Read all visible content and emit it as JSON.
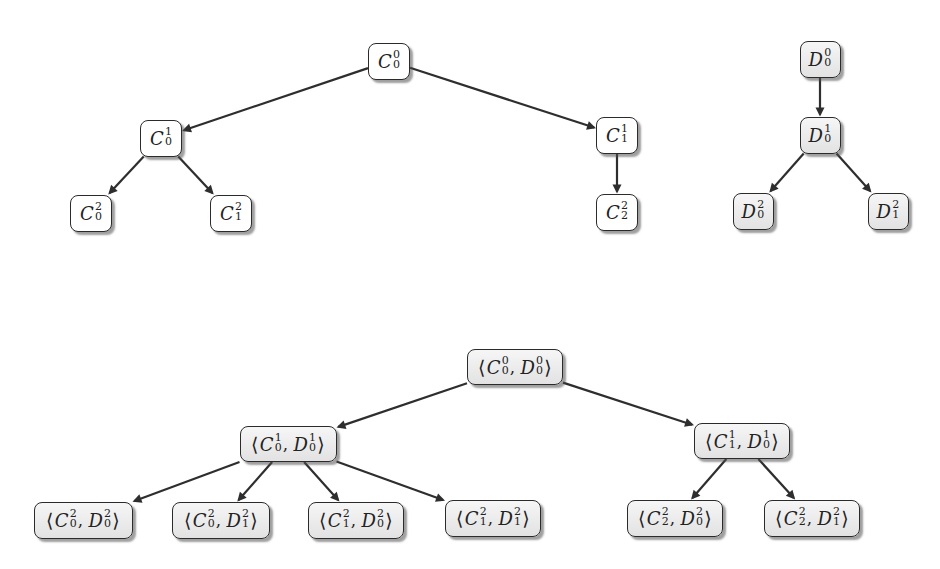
{
  "diagram": {
    "type": "tree-product-diagram",
    "trees": [
      {
        "id": "tree-c",
        "fill": "white",
        "nodes": [
          {
            "id": "c00",
            "label": {
              "base": "C",
              "sup": "0",
              "sub": "0"
            },
            "cx": 389,
            "cy": 61,
            "w": 42,
            "h": 37
          },
          {
            "id": "c01",
            "label": {
              "base": "C",
              "sup": "1",
              "sub": "0"
            },
            "cx": 161,
            "cy": 138,
            "w": 42,
            "h": 37
          },
          {
            "id": "c11",
            "label": {
              "base": "C",
              "sup": "1",
              "sub": "1"
            },
            "cx": 617,
            "cy": 135,
            "w": 42,
            "h": 37
          },
          {
            "id": "c02",
            "label": {
              "base": "C",
              "sup": "2",
              "sub": "0"
            },
            "cx": 91,
            "cy": 213,
            "w": 42,
            "h": 37
          },
          {
            "id": "c12",
            "label": {
              "base": "C",
              "sup": "2",
              "sub": "1"
            },
            "cx": 231,
            "cy": 213,
            "w": 42,
            "h": 37
          },
          {
            "id": "c22",
            "label": {
              "base": "C",
              "sup": "2",
              "sub": "2"
            },
            "cx": 617,
            "cy": 212,
            "w": 42,
            "h": 37
          }
        ],
        "edges": [
          [
            "c00",
            "c01"
          ],
          [
            "c00",
            "c11"
          ],
          [
            "c01",
            "c02"
          ],
          [
            "c01",
            "c12"
          ],
          [
            "c11",
            "c22"
          ]
        ]
      },
      {
        "id": "tree-d",
        "fill": "gray",
        "nodes": [
          {
            "id": "d00",
            "label": {
              "base": "D",
              "sup": "0",
              "sub": "0"
            },
            "cx": 820,
            "cy": 59,
            "w": 41,
            "h": 37
          },
          {
            "id": "d01",
            "label": {
              "base": "D",
              "sup": "1",
              "sub": "0"
            },
            "cx": 820,
            "cy": 135,
            "w": 41,
            "h": 37
          },
          {
            "id": "d02",
            "label": {
              "base": "D",
              "sup": "2",
              "sub": "0"
            },
            "cx": 753,
            "cy": 211,
            "w": 41,
            "h": 37
          },
          {
            "id": "d12",
            "label": {
              "base": "D",
              "sup": "2",
              "sub": "1"
            },
            "cx": 888,
            "cy": 211,
            "w": 41,
            "h": 37
          }
        ],
        "edges": [
          [
            "d00",
            "d01"
          ],
          [
            "d01",
            "d02"
          ],
          [
            "d01",
            "d12"
          ]
        ]
      },
      {
        "id": "tree-product",
        "fill": "gray",
        "nodes": [
          {
            "id": "p0",
            "label": {
              "pair": [
                {
                  "base": "C",
                  "sup": "0",
                  "sub": "0"
                },
                {
                  "base": "D",
                  "sup": "0",
                  "sub": "0"
                }
              ]
            },
            "cx": 515,
            "cy": 367,
            "w": 96,
            "h": 36
          },
          {
            "id": "p1a",
            "label": {
              "pair": [
                {
                  "base": "C",
                  "sup": "1",
                  "sub": "0"
                },
                {
                  "base": "D",
                  "sup": "1",
                  "sub": "0"
                }
              ]
            },
            "cx": 288,
            "cy": 444,
            "w": 97,
            "h": 36
          },
          {
            "id": "p1b",
            "label": {
              "pair": [
                {
                  "base": "C",
                  "sup": "1",
                  "sub": "1"
                },
                {
                  "base": "D",
                  "sup": "1",
                  "sub": "0"
                }
              ]
            },
            "cx": 742,
            "cy": 441,
            "w": 96,
            "h": 36
          },
          {
            "id": "p2a",
            "label": {
              "pair": [
                {
                  "base": "C",
                  "sup": "2",
                  "sub": "0"
                },
                {
                  "base": "D",
                  "sup": "2",
                  "sub": "0"
                }
              ]
            },
            "cx": 83,
            "cy": 520,
            "w": 99,
            "h": 37
          },
          {
            "id": "p2b",
            "label": {
              "pair": [
                {
                  "base": "C",
                  "sup": "2",
                  "sub": "0"
                },
                {
                  "base": "D",
                  "sup": "2",
                  "sub": "1"
                }
              ]
            },
            "cx": 221,
            "cy": 520,
            "w": 98,
            "h": 37
          },
          {
            "id": "p2c",
            "label": {
              "pair": [
                {
                  "base": "C",
                  "sup": "2",
                  "sub": "1"
                },
                {
                  "base": "D",
                  "sup": "2",
                  "sub": "0"
                }
              ]
            },
            "cx": 356,
            "cy": 520,
            "w": 96,
            "h": 37
          },
          {
            "id": "p2d",
            "label": {
              "pair": [
                {
                  "base": "C",
                  "sup": "2",
                  "sub": "1"
                },
                {
                  "base": "D",
                  "sup": "2",
                  "sub": "1"
                }
              ]
            },
            "cx": 493,
            "cy": 518,
            "w": 96,
            "h": 37
          },
          {
            "id": "p2e",
            "label": {
              "pair": [
                {
                  "base": "C",
                  "sup": "2",
                  "sub": "2"
                },
                {
                  "base": "D",
                  "sup": "2",
                  "sub": "0"
                }
              ]
            },
            "cx": 675,
            "cy": 518,
            "w": 96,
            "h": 37
          },
          {
            "id": "p2f",
            "label": {
              "pair": [
                {
                  "base": "C",
                  "sup": "2",
                  "sub": "2"
                },
                {
                  "base": "D",
                  "sup": "2",
                  "sub": "1"
                }
              ]
            },
            "cx": 812,
            "cy": 518,
            "w": 96,
            "h": 37
          }
        ],
        "edges": [
          [
            "p0",
            "p1a"
          ],
          [
            "p0",
            "p1b"
          ],
          [
            "p1a",
            "p2a"
          ],
          [
            "p1a",
            "p2b"
          ],
          [
            "p1a",
            "p2c"
          ],
          [
            "p1a",
            "p2d"
          ],
          [
            "p1b",
            "p2e"
          ],
          [
            "p1b",
            "p2f"
          ]
        ]
      }
    ],
    "colors": {
      "edge": "#2e2e2e",
      "border": "#2b2b2b",
      "white_fill": "#ffffff",
      "gray_fill_top": "#f6f6f6",
      "gray_fill_bottom": "#e2e2e2",
      "shadow": "#505050"
    },
    "symbols": {
      "left_angle": "⟨",
      "right_angle": "⟩",
      "comma": ","
    }
  }
}
